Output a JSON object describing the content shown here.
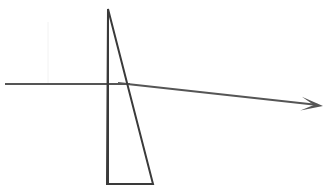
{
  "canvas": {
    "width": 327,
    "height": 192,
    "background_color": "#ffffff",
    "title": "Optics ray diagram: refraction through a triangular prism"
  },
  "colors": {
    "prism_stroke": "#3a3a3a",
    "ray_stroke": "#555555",
    "guide_stroke": "#f2f2f2",
    "background": "#ffffff"
  },
  "chart_data": {
    "type": "line",
    "title": "",
    "xlabel": "",
    "ylabel": "",
    "xlim": [
      0,
      327
    ],
    "ylim": [
      192,
      0
    ],
    "grid": false,
    "legend": null,
    "series": [
      {
        "name": "prism-left-edge",
        "kind": "polyline",
        "color": "#3a3a3a",
        "width": 2,
        "points": [
          [
            108,
            9
          ],
          [
            108,
            184
          ]
        ]
      },
      {
        "name": "prism-hypotenuse",
        "kind": "polyline",
        "color": "#3a3a3a",
        "width": 2,
        "points": [
          [
            108,
            9
          ],
          [
            153,
            184
          ]
        ]
      },
      {
        "name": "prism-base",
        "kind": "polyline",
        "color": "#3a3a3a",
        "width": 2,
        "points": [
          [
            107,
            184
          ],
          [
            153,
            184
          ]
        ]
      },
      {
        "name": "incident-ray",
        "kind": "polyline",
        "color": "#555555",
        "width": 2,
        "points": [
          [
            5,
            84
          ],
          [
            130,
            84
          ]
        ]
      },
      {
        "name": "refracted-ray",
        "kind": "polyline",
        "color": "#555555",
        "width": 2,
        "points": [
          [
            118,
            83
          ],
          [
            318,
            105
          ]
        ]
      },
      {
        "name": "guide-line",
        "kind": "polyline",
        "color": "#f2f2f2",
        "width": 1,
        "points": [
          [
            48,
            22
          ],
          [
            48,
            84
          ]
        ]
      }
    ],
    "markers": [
      {
        "name": "ray-arrowhead",
        "kind": "arrowhead",
        "color": "#555555",
        "tip": [
          323,
          106
        ],
        "angle_deg": 6.3,
        "length": 22,
        "half_width": 7
      }
    ],
    "annotations": []
  },
  "shapes": {
    "prism": {
      "label": "triangular-prism",
      "apex": [
        108,
        9
      ],
      "bottom_left": [
        107,
        184
      ],
      "bottom_right": [
        153,
        184
      ]
    },
    "incident_ray": {
      "label": "incident-ray",
      "start": [
        5,
        84
      ],
      "end": [
        130,
        84
      ]
    },
    "refracted_ray": {
      "label": "refracted-ray",
      "start": [
        118,
        83
      ],
      "end": [
        318,
        105
      ],
      "arrow_tip": [
        323,
        106
      ]
    },
    "guide": {
      "label": "faint-guide-line",
      "start": [
        48,
        22
      ],
      "end": [
        48,
        84
      ]
    }
  }
}
